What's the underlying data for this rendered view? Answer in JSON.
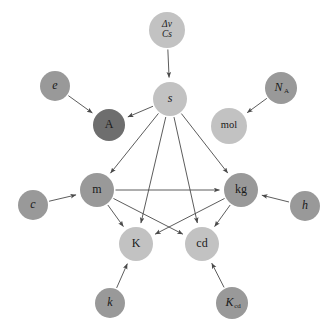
{
  "figure": {
    "background": "#ffffff",
    "edge_color": "#4a4a4a",
    "label_color": "#1a1a1a"
  },
  "palette": {
    "light": "#c2c2c2",
    "medium": "#999999",
    "dark": "#6e6e6e"
  },
  "chart_data": {
    "type": "diagram",
    "layout": "directed-graph",
    "nodes": [
      {
        "id": "dnu_cs",
        "label": "Δν",
        "sublabel": "Cs",
        "two_line": true,
        "line1": "Δν",
        "line2": "Cs",
        "x": 167,
        "y": 30,
        "r": 18,
        "shade": "light",
        "style": "italic"
      },
      {
        "id": "s",
        "label": "s",
        "x": 170,
        "y": 99,
        "r": 17,
        "shade": "light",
        "style": "italic"
      },
      {
        "id": "e",
        "label": "e",
        "x": 55,
        "y": 86,
        "r": 15,
        "shade": "medium",
        "style": "italic"
      },
      {
        "id": "A",
        "label": "A",
        "x": 109,
        "y": 125,
        "r": 16,
        "shade": "dark",
        "style": "upright"
      },
      {
        "id": "N_A",
        "label": "N",
        "sublabel": "A",
        "x": 281,
        "y": 88,
        "r": 16,
        "shade": "medium",
        "style": "italic"
      },
      {
        "id": "mol",
        "label": "mol",
        "x": 229,
        "y": 126,
        "r": 18,
        "shade": "light",
        "style": "upright"
      },
      {
        "id": "m",
        "label": "m",
        "x": 97,
        "y": 190,
        "r": 17,
        "shade": "medium",
        "style": "upright"
      },
      {
        "id": "kg",
        "label": "kg",
        "x": 241,
        "y": 190,
        "r": 17,
        "shade": "medium",
        "style": "upright"
      },
      {
        "id": "c",
        "label": "c",
        "x": 33,
        "y": 205,
        "r": 15,
        "shade": "medium",
        "style": "italic"
      },
      {
        "id": "h",
        "label": "h",
        "x": 305,
        "y": 206,
        "r": 15,
        "shade": "medium",
        "style": "italic"
      },
      {
        "id": "K",
        "label": "K",
        "x": 136,
        "y": 244,
        "r": 17,
        "shade": "light",
        "style": "upright"
      },
      {
        "id": "cd",
        "label": "cd",
        "x": 202,
        "y": 244,
        "r": 17,
        "shade": "light",
        "style": "upright"
      },
      {
        "id": "k",
        "label": "k",
        "x": 110,
        "y": 303,
        "r": 15,
        "shade": "medium",
        "style": "italic"
      },
      {
        "id": "K_cd",
        "label": "K",
        "sublabel": "cd",
        "x": 232,
        "y": 303,
        "r": 16,
        "shade": "medium",
        "style": "italic"
      }
    ],
    "edges": [
      {
        "from": "dnu_cs",
        "to": "s"
      },
      {
        "from": "e",
        "to": "A"
      },
      {
        "from": "s",
        "to": "A"
      },
      {
        "from": "N_A",
        "to": "mol"
      },
      {
        "from": "s",
        "to": "m"
      },
      {
        "from": "s",
        "to": "kg"
      },
      {
        "from": "s",
        "to": "K"
      },
      {
        "from": "s",
        "to": "cd"
      },
      {
        "from": "c",
        "to": "m"
      },
      {
        "from": "h",
        "to": "kg"
      },
      {
        "from": "m",
        "to": "kg"
      },
      {
        "from": "m",
        "to": "K"
      },
      {
        "from": "m",
        "to": "cd"
      },
      {
        "from": "kg",
        "to": "K"
      },
      {
        "from": "kg",
        "to": "cd"
      },
      {
        "from": "k",
        "to": "K"
      },
      {
        "from": "K_cd",
        "to": "cd"
      }
    ]
  }
}
